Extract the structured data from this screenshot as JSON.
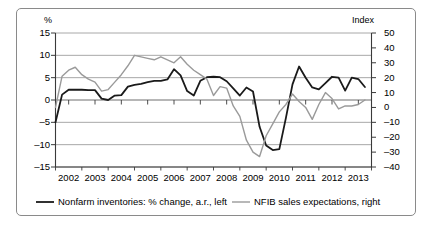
{
  "chart_data": {
    "type": "line",
    "title": "",
    "xlabel": "",
    "ylabel_left": "%",
    "ylabel_right": "Index",
    "grid": true,
    "legend_position": "bottom",
    "xlim": [
      2002.0,
      2014.0
    ],
    "ylim_left": [
      -15,
      15
    ],
    "ylim_right": [
      -40,
      50
    ],
    "ytick_left_labels": [
      "15",
      "10",
      "5",
      "0",
      "-5",
      "-10",
      "-15"
    ],
    "ytick_left_values": [
      15,
      10,
      5,
      0,
      -5,
      -10,
      -15
    ],
    "ytick_right_labels": [
      "50",
      "40",
      "30",
      "20",
      "10",
      "0",
      "-10",
      "-20",
      "-30",
      "-40"
    ],
    "ytick_right_values": [
      50,
      40,
      30,
      20,
      10,
      0,
      -10,
      -20,
      -30,
      -40
    ],
    "xtick_labels": [
      "2002",
      "2003",
      "2004",
      "2005",
      "2006",
      "2007",
      "2008",
      "2009",
      "2010",
      "2011",
      "2012",
      "2013"
    ],
    "xtick_values": [
      2002,
      2003,
      2004,
      2005,
      2006,
      2007,
      2008,
      2009,
      2010,
      2011,
      2012,
      2013
    ],
    "series": [
      {
        "name": "Nonfarm inventories: % change, a.r., left",
        "axis": "left",
        "color": "#1a1a1a",
        "width": 1.8,
        "x": [
          2002.0,
          2002.25,
          2002.5,
          2002.75,
          2003.0,
          2003.25,
          2003.5,
          2003.75,
          2004.0,
          2004.25,
          2004.5,
          2004.75,
          2005.0,
          2005.25,
          2005.5,
          2005.75,
          2006.0,
          2006.25,
          2006.5,
          2006.75,
          2007.0,
          2007.25,
          2007.5,
          2007.75,
          2008.0,
          2008.25,
          2008.5,
          2008.75,
          2009.0,
          2009.25,
          2009.5,
          2009.75,
          2010.0,
          2010.25,
          2010.5,
          2010.75,
          2011.0,
          2011.25,
          2011.5,
          2011.75,
          2012.0,
          2012.25,
          2012.5,
          2012.75,
          2013.0,
          2013.25,
          2013.5,
          2013.75
        ],
        "values": [
          -5.0,
          1.2,
          2.3,
          2.3,
          2.3,
          2.2,
          2.2,
          0.3,
          0.0,
          1.0,
          1.1,
          3.0,
          3.4,
          3.6,
          4.0,
          4.3,
          4.3,
          4.6,
          6.9,
          5.5,
          2.0,
          1.0,
          4.3,
          5.1,
          5.2,
          5.1,
          4.2,
          2.6,
          1.0,
          2.8,
          1.9,
          -6.0,
          -10.2,
          -11.2,
          -11.0,
          -4.0,
          3.5,
          7.5,
          5.0,
          2.8,
          2.4,
          3.8,
          5.2,
          5.0,
          2.1,
          5.0,
          4.7,
          2.9
        ],
        "note": "quarterly percent change annual rate, plotted on left axis"
      },
      {
        "name": "NFIB sales expectations, right",
        "axis": "right",
        "color": "#9a9a9a",
        "width": 1.4,
        "x": [
          2002.0,
          2002.25,
          2002.5,
          2002.75,
          2003.0,
          2003.25,
          2003.5,
          2003.75,
          2004.0,
          2004.25,
          2004.5,
          2004.75,
          2005.0,
          2005.25,
          2005.5,
          2005.75,
          2006.0,
          2006.25,
          2006.5,
          2006.75,
          2007.0,
          2007.25,
          2007.5,
          2007.75,
          2008.0,
          2008.25,
          2008.5,
          2008.75,
          2009.0,
          2009.25,
          2009.5,
          2009.75,
          2010.0,
          2010.25,
          2010.5,
          2010.75,
          2011.0,
          2011.25,
          2011.5,
          2011.75,
          2012.0,
          2012.25,
          2012.5,
          2012.75,
          2013.0,
          2013.25,
          2013.5,
          2013.75
        ],
        "values": [
          0,
          21,
          25,
          27,
          22,
          19,
          17,
          11,
          12,
          17,
          22,
          28,
          35,
          34,
          33,
          32,
          34,
          32,
          30,
          34,
          29,
          25,
          22,
          19,
          8,
          14,
          13,
          1,
          -6,
          -22,
          -30,
          -33,
          -19,
          -11,
          -3,
          2,
          9,
          4,
          0,
          -8,
          2,
          10,
          6,
          -1,
          1,
          1,
          2,
          5
        ],
        "note": "NFIB small business sales expectations index, plotted on right axis"
      }
    ]
  },
  "axis_titles": {
    "left": "%",
    "right": "Index"
  },
  "legend": {
    "entries": [
      {
        "label": "Nonfarm inventories: % change, a.r., left",
        "color": "#1a1a1a"
      },
      {
        "label": "NFIB sales expectations, right",
        "color": "#9a9a9a"
      }
    ]
  }
}
